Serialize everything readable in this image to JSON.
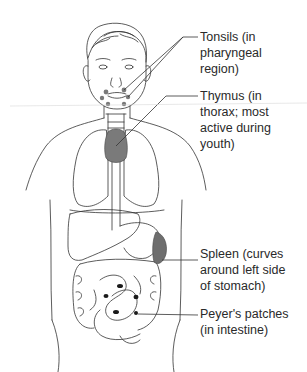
{
  "figure": {
    "colors": {
      "outline": "#333333",
      "tissue_fill": "#7a7a7a",
      "spleen_fill": "#6e6e6e",
      "patch_fill": "#1a1a1a",
      "text": "#2a2a2a"
    }
  },
  "labels": [
    {
      "id": "tonsils",
      "lines": [
        "Tonsils (in",
        "pharyngeal",
        "region)"
      ]
    },
    {
      "id": "thymus",
      "lines": [
        "Thymus (in",
        "thorax; most",
        "active during",
        "youth)"
      ]
    },
    {
      "id": "spleen",
      "lines": [
        "Spleen (curves",
        "around left side",
        "of stomach)"
      ]
    },
    {
      "id": "peyers-patches",
      "lines": [
        "Peyer's patches",
        "(in intestine)"
      ]
    }
  ]
}
